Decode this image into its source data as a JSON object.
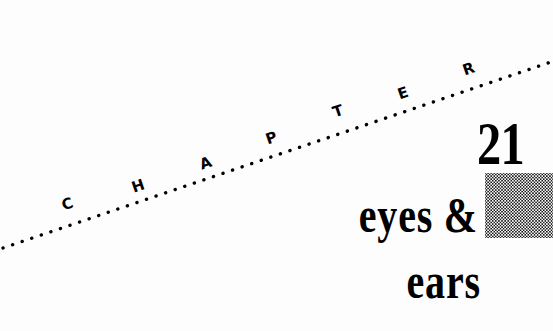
{
  "page": {
    "width": 553,
    "height": 331,
    "background_color": "#fdfdfd",
    "ink_color": "#000000",
    "kind": "book-chapter-opener"
  },
  "chapter_label": {
    "text": "CHAPTER",
    "letters": [
      "C",
      "H",
      "A",
      "P",
      "T",
      "E",
      "R"
    ],
    "style": "bold sans-serif small caps set along a rising dotted rule"
  },
  "chapter_number": {
    "value": "21"
  },
  "title": {
    "full": "eyes & ears",
    "line_1": "eyes &",
    "line_2": "ears"
  },
  "decoration": {
    "dotted_rule": {
      "name": "dotted-diagonal-rule",
      "start_x": 3,
      "start_y": 248,
      "end_x": 551,
      "end_y": 62,
      "dot_color": "#000000",
      "dot_diameter": 3,
      "dot_spacing": 10
    },
    "halftone_square": {
      "name": "halftone-swatch",
      "x": 485,
      "y": 173,
      "width": 68,
      "height": 65,
      "dot_color": "#1a1a1a",
      "fill_color": "#ffffff"
    }
  }
}
